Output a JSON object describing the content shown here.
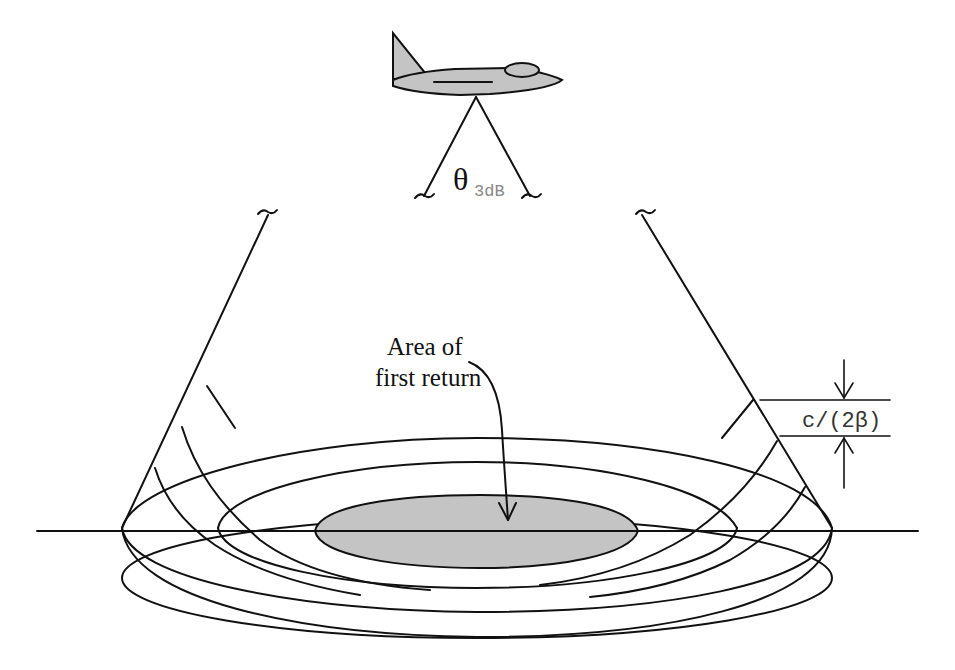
{
  "diagram": {
    "labels": {
      "beamwidth_symbol": "θ",
      "beamwidth_subscript": "3dB",
      "area_line1": "Area of",
      "area_line2": "first return",
      "range_resolution": "c/(2β)"
    },
    "elements": {
      "aircraft": "aircraft-icon",
      "beam_cone": "two diagonal beam edge lines with break marks (~)",
      "ground_line": "horizontal ground line",
      "rings": [
        "inner shaded ellipse (first return)",
        "second ring",
        "third ring",
        "outer ring"
      ],
      "dimension_arrows": "down/up arrows bounding c/(2β)"
    },
    "colors": {
      "line": "#111111",
      "fill_gray": "#c4c4c4",
      "background": "#ffffff",
      "subscript": "#888888"
    }
  }
}
